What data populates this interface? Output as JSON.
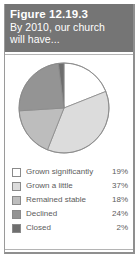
{
  "figure": {
    "title": "Figure 12.19.3",
    "subtitle_line1": "By 2010, our church",
    "subtitle_line2": "will have...",
    "header_bg": "#757575",
    "header_text_color": "#ffffff",
    "panel_bg": "#ffffff",
    "panel_border": "#b4b4b4"
  },
  "chart_data": {
    "type": "pie",
    "title": "By 2010, our church will have...",
    "categories": [
      "Grown significantly",
      "Grown a little",
      "Remained stable",
      "Declined",
      "Closed"
    ],
    "values": [
      19,
      37,
      18,
      24,
      2
    ],
    "value_labels": [
      "19%",
      "37%",
      "18%",
      "24%",
      "2%"
    ],
    "colors": [
      "#ffffff",
      "#dcdcdc",
      "#bdbdbd",
      "#949494",
      "#6e6e6e"
    ],
    "slice_border": "#8a8a8a",
    "start_angle_deg": -90,
    "direction": "clockwise",
    "legend_position": "bottom",
    "grid": false
  },
  "legend": {
    "rows": [
      {
        "label": "Grown significantly",
        "value": "19%",
        "color": "#ffffff"
      },
      {
        "label": "Grown a little",
        "value": "37%",
        "color": "#dcdcdc"
      },
      {
        "label": "Remained stable",
        "value": "18%",
        "color": "#bdbdbd"
      },
      {
        "label": "Declined",
        "value": "24%",
        "color": "#949494"
      },
      {
        "label": "Closed",
        "value": "2%",
        "color": "#6e6e6e"
      }
    ]
  }
}
